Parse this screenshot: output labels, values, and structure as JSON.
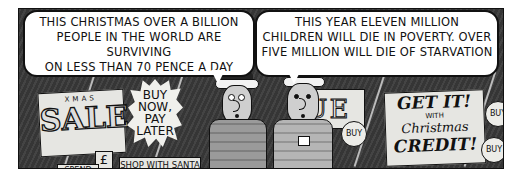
{
  "comic": {
    "speech_bubbles": [
      {
        "speaker": "left-figure",
        "text": "THIS CHRISTMAS OVER A BILLION\nPEOPLE IN THE WORLD ARE SURVIVING\nON LESS THAN 70 PENCE A DAY"
      },
      {
        "speaker": "right-figure",
        "text": "THIS YEAR ELEVEN MILLION\nCHILDREN WILL DIE IN POVERTY. OVER\nFIVE MILLION WILL DIE OF STARVATION"
      }
    ],
    "signs": {
      "sale_small": "XMAS",
      "sale_big": "SALE",
      "buy_now": "BUY\nNOW, PAY\nLATER",
      "pound": "£",
      "spend": "SPEND",
      "shop_santa": "SHOP WITH SANTA",
      "value_partial": "UE",
      "credit_l1": "GET IT!",
      "credit_l2": "WITH",
      "credit_l3": "Christmas",
      "credit_l4": "CREDIT!",
      "buy_badge_1": "BUY",
      "buy_badge_2": "BUY",
      "buy_badge_3": "BUY"
    }
  }
}
